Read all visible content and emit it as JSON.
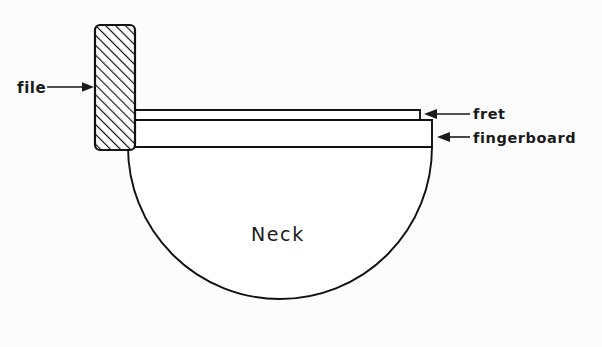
{
  "figure": {
    "background_color": "#fcfcfc",
    "line_color": "#111111",
    "text_color": "#1a1a1a"
  },
  "labels": {
    "file": "file",
    "fret": "fret",
    "fingerboard": "fingerboard",
    "neck": "Neck"
  },
  "parts": {
    "file": {
      "name": "file",
      "shape": "hatched-rectangle",
      "hatch_angle_deg": 45,
      "fill": "diagonal-hatch"
    },
    "fret": {
      "name": "fret",
      "shape": "thin-horizontal-bar",
      "fill": "#ffffff"
    },
    "fingerboard": {
      "name": "fingerboard",
      "shape": "horizontal-bar",
      "fill": "#ffffff"
    },
    "neck": {
      "name": "neck",
      "shape": "semicircle",
      "fill": "#ffffff"
    }
  },
  "annotations": {
    "file_arrow_direction": "right",
    "fret_arrow_direction": "left",
    "fingerboard_arrow_direction": "left"
  }
}
